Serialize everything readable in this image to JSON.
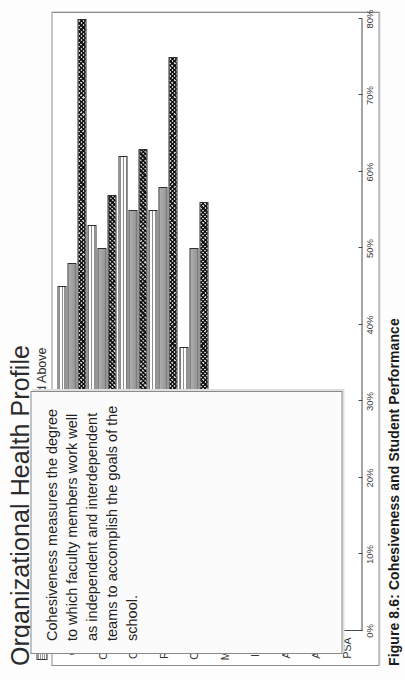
{
  "chart": {
    "title": "Organizational Health Profile",
    "legend": [
      {
        "label": "50 and Below",
        "swatch": "pattern-light-hatch"
      },
      {
        "label": "51 74",
        "swatch": "solid-gray"
      },
      {
        "label": "75 and Above",
        "swatch": "pattern-dark-checker"
      }
    ]
  },
  "callout": {
    "text": "Cohesiveness measures the degree to which faculty members work well as independent and interdependent teams to accomplish the goals of the school."
  },
  "caption": {
    "text": "Figure 8.6:  Cohesiveness and Student Performance"
  },
  "chart_data": {
    "type": "bar",
    "orientation": "horizontal",
    "title": "Organizational Health Profile",
    "xlabel": "",
    "ylabel": "",
    "categories": [
      "GF",
      "CON",
      "OPE",
      "RES",
      "COH",
      "MOR",
      "INN",
      "AUT",
      "ADA",
      "PSA"
    ],
    "tick_labels": [
      "0%",
      "10%",
      "20%",
      "30%",
      "40%",
      "50%",
      "60%",
      "70%",
      "80%"
    ],
    "tick_values": [
      0,
      10,
      20,
      30,
      40,
      50,
      60,
      70,
      80
    ],
    "xlim": [
      0,
      80
    ],
    "grid": false,
    "legend_position": "top-left",
    "series": [
      {
        "name": "50 and Below",
        "values": [
          45,
          53,
          62,
          55,
          37,
          null,
          null,
          null,
          null,
          null
        ]
      },
      {
        "name": "51 74",
        "values": [
          48,
          50,
          55,
          58,
          50,
          null,
          null,
          null,
          null,
          null
        ]
      },
      {
        "name": "75 and Above",
        "values": [
          80,
          57,
          63,
          75,
          56,
          null,
          null,
          null,
          null,
          null
        ]
      }
    ],
    "note": "Bars for MOR, INN, AUT, ADA and PSA are covered by the overlaid text callout box."
  }
}
